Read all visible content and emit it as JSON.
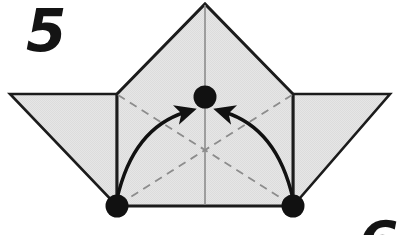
{
  "figure": {
    "step_number": "5",
    "next_step_number": "6",
    "background_color": "#ffffff",
    "paper_fill_color": "#e3e3e3",
    "paper_edge_color": "#1c1c1c",
    "crease_line_color": "#8c8c8c",
    "marker_color": "#111111",
    "arrow_color": "#111111"
  },
  "diagram_data": {
    "type": "origami-fold-step",
    "title": "Step 5",
    "description": "Two bottom corner points are folded inward along dashed creases toward the marked center point.",
    "canvas": {
      "width": 399,
      "height": 235
    },
    "vertices": {
      "apex": [
        205,
        4
      ],
      "left_junction": [
        117,
        94
      ],
      "right_junction": [
        293,
        94
      ],
      "left_wing_tip": [
        10,
        94
      ],
      "right_wing_tip": [
        390,
        94
      ],
      "left_base": [
        117,
        206
      ],
      "right_base": [
        293,
        206
      ],
      "center_target": [
        205,
        97
      ]
    },
    "shapes": [
      {
        "name": "center-body",
        "kind": "polygon",
        "points": [
          [
            117,
            94
          ],
          [
            205,
            4
          ],
          [
            293,
            94
          ],
          [
            293,
            206
          ],
          [
            117,
            206
          ]
        ],
        "fill": "#e3e3e3",
        "stroke": "#1c1c1c"
      },
      {
        "name": "left-wing",
        "kind": "polygon",
        "points": [
          [
            10,
            94
          ],
          [
            117,
            94
          ],
          [
            117,
            206
          ]
        ],
        "fill": "#e3e3e3",
        "stroke": "#1c1c1c"
      },
      {
        "name": "right-wing",
        "kind": "polygon",
        "points": [
          [
            390,
            94
          ],
          [
            293,
            94
          ],
          [
            293,
            206
          ]
        ],
        "fill": "#e3e3e3",
        "stroke": "#1c1c1c"
      }
    ],
    "crease_lines": [
      {
        "name": "vertical-center-crease",
        "from": [
          205,
          4
        ],
        "to": [
          205,
          206
        ],
        "style": "solid-thin",
        "color": "#8c8c8c"
      },
      {
        "name": "left-diagonal-crease",
        "from": [
          117,
          94
        ],
        "to": [
          293,
          206
        ],
        "style": "dashed",
        "color": "#8c8c8c"
      },
      {
        "name": "right-diagonal-crease",
        "from": [
          293,
          94
        ],
        "to": [
          117,
          206
        ],
        "style": "dashed",
        "color": "#8c8c8c"
      }
    ],
    "markers": [
      {
        "name": "center-point-marker",
        "at": [
          205,
          97
        ],
        "radius": 11,
        "color": "#111111"
      },
      {
        "name": "left-corner-marker",
        "at": [
          117,
          206
        ],
        "radius": 11,
        "color": "#111111"
      },
      {
        "name": "right-corner-marker",
        "at": [
          293,
          206
        ],
        "radius": 11,
        "color": "#111111"
      }
    ],
    "arrows": [
      {
        "name": "left-fold-arrow",
        "from": [
          117,
          201
        ],
        "to": [
          191,
          110
        ],
        "control": [
          131,
          126
        ],
        "direction": "up-right",
        "color": "#111111"
      },
      {
        "name": "right-fold-arrow",
        "from": [
          293,
          201
        ],
        "to": [
          219,
          110
        ],
        "control": [
          279,
          126
        ],
        "direction": "up-left",
        "color": "#111111"
      }
    ]
  }
}
